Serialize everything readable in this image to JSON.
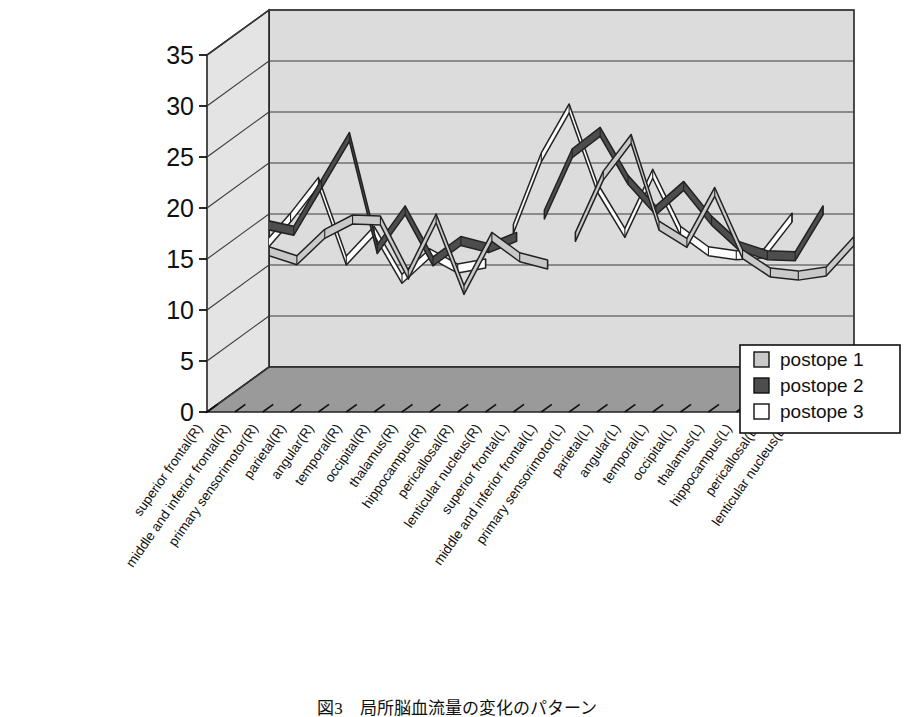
{
  "chart_data": {
    "type": "line",
    "title": "H.U.（contusion・ASDH）（5,9→10,17）",
    "xlabel": "",
    "ylabel": "",
    "ylim": [
      0,
      35
    ],
    "ytick_step": 5,
    "yticks": [
      "0",
      "5",
      "10",
      "15",
      "20",
      "25",
      "30",
      "35"
    ],
    "grid": true,
    "style": "3d-ribbon",
    "legend_position": "bottom-right",
    "categories": [
      "superior frontal(R)",
      "middle and inferior frontal(R)",
      "primary sensorimotor(R)",
      "parietal(R)",
      "angular(R)",
      "temporal(R)",
      "occipital(R)",
      "thalamus(R)",
      "hippocampus(R)",
      "pericallosal(R)",
      "lenticular nucleus(R)",
      "superior frontal(L)",
      "middle and inferior frontal(L)",
      "primary sensorimotor(L)",
      "parietal(L)",
      "angular(L)",
      "temporal(L)",
      "occipital(L)",
      "thalamus(L)",
      "hippocampus(L)",
      "pericallosal(L)",
      "lenticular nucleus(L)"
    ],
    "series": [
      {
        "name": "postope 1",
        "color": "#c9c9c9",
        "values": [
          11.8,
          10.9,
          13.5,
          14.9,
          14.8,
          9.5,
          15.0,
          8.0,
          13.2,
          11.2,
          10.5,
          13.2,
          19.2,
          22.8,
          14.3,
          12.6,
          17.6,
          11.5,
          9.7,
          9.4,
          9.8,
          12.8
        ]
      },
      {
        "name": "postope 2",
        "color": "#4d4d4d",
        "values": [
          16.4,
          16.6,
          16.0,
          20.6,
          25.2,
          14.2,
          18.0,
          13.0,
          15.0,
          14.3,
          15.4,
          17.6,
          23.6,
          25.7,
          21.0,
          18.0,
          20.4,
          17.0,
          14.5,
          13.6,
          13.5,
          18.0
        ]
      },
      {
        "name": "postope 3",
        "color": "#ffffff",
        "values": [
          16.0,
          16.3,
          16.4,
          19.5,
          23.0,
          15.3,
          18.2,
          13.5,
          16.0,
          14.5,
          15.0,
          18.4,
          25.4,
          30.2,
          22.5,
          18.0,
          23.8,
          18.2,
          16.2,
          15.8,
          16.0,
          19.5
        ]
      }
    ]
  },
  "legend": {
    "items": [
      {
        "label": "postope 1",
        "swatch": "#c9c9c9"
      },
      {
        "label": "postope 2",
        "swatch": "#4d4d4d"
      },
      {
        "label": "postope 3",
        "swatch": "#ffffff"
      }
    ]
  },
  "caption": "図3　局所脳血流量の変化のパターン",
  "colors": {
    "back_wall": "#dcdcdc",
    "floor": "#9a9a9a",
    "side_wall": "#e4e4e4",
    "outline": "#222222",
    "grid": "#3a3a3a"
  }
}
